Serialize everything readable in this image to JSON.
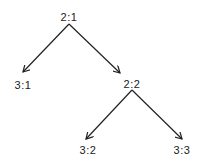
{
  "diagram": {
    "type": "tree",
    "nodes": [
      {
        "id": "2:1",
        "label": "2:1",
        "x": 69,
        "y": 17
      },
      {
        "id": "3:1",
        "label": "3:1",
        "x": 23,
        "y": 85
      },
      {
        "id": "2:2",
        "label": "2:2",
        "x": 132,
        "y": 84
      },
      {
        "id": "3:2",
        "label": "3:2",
        "x": 88,
        "y": 150
      },
      {
        "id": "3:3",
        "label": "3:3",
        "x": 182,
        "y": 150
      }
    ],
    "edges": [
      {
        "from": "2:1",
        "to": "3:1"
      },
      {
        "from": "2:1",
        "to": "2:2"
      },
      {
        "from": "2:2",
        "to": "3:2"
      },
      {
        "from": "2:2",
        "to": "3:3"
      }
    ],
    "colors": {
      "line": "#222222",
      "text": "#222222",
      "background": "#ffffff"
    }
  }
}
